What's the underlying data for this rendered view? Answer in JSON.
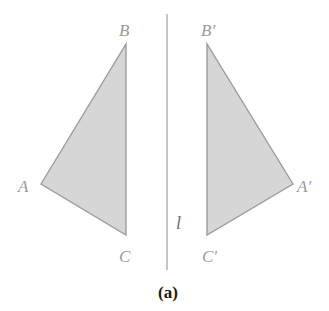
{
  "figure": {
    "caption": "(a)",
    "mirror_line": {
      "label": "l",
      "x": 167,
      "y1": 14,
      "y2": 270,
      "color": "#a8a8a8"
    },
    "original_triangle": {
      "name": "ABC",
      "fill": "#d6d6d6",
      "stroke": "#9c9c9c",
      "vertices": {
        "A": {
          "label": "A",
          "x": 41,
          "y": 184
        },
        "B": {
          "label": "B",
          "x": 126,
          "y": 44
        },
        "C": {
          "label": "C",
          "x": 126,
          "y": 235
        }
      }
    },
    "reflected_triangle": {
      "name": "A'B'C'",
      "fill": "#d6d6d6",
      "stroke": "#9c9c9c",
      "vertices": {
        "A": {
          "label": "A′",
          "x": 293,
          "y": 184
        },
        "B": {
          "label": "B′",
          "x": 207,
          "y": 44
        },
        "C": {
          "label": "C′",
          "x": 207,
          "y": 235
        }
      }
    }
  }
}
